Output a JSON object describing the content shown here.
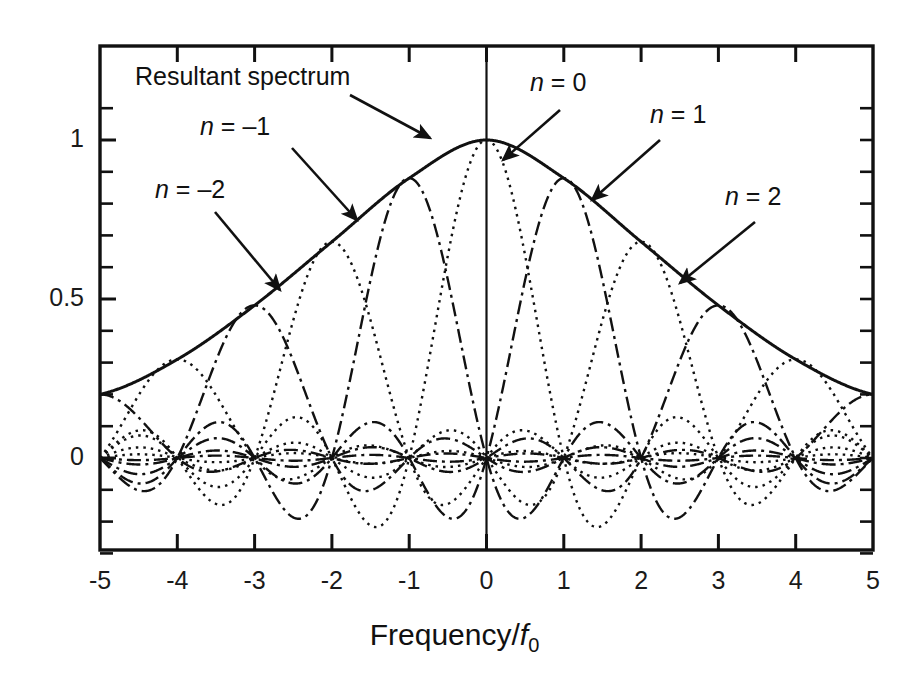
{
  "chart_data": {
    "type": "line",
    "title": "",
    "xlabel": "Frequency/f0",
    "xlabel_parts": {
      "prefix": "Frequency/",
      "italic": "f",
      "sub": "0"
    },
    "ylabel": "",
    "xlim": [
      -5,
      5
    ],
    "ylim": [
      -0.32,
      1.12
    ],
    "grid": false,
    "legend_position": "annotations-with-arrows",
    "x_ticks": [
      -5,
      -4,
      -3,
      -2,
      -1,
      0,
      1,
      2,
      3,
      4,
      5
    ],
    "x_tick_labels": [
      "-5",
      "-4",
      "-3",
      "-2",
      "-1",
      "0",
      "1",
      "2",
      "3",
      "4",
      "5"
    ],
    "y_ticks": [
      0,
      0.5,
      1
    ],
    "y_tick_labels": [
      "0",
      "0.5",
      "1"
    ],
    "y_minor_ticks": [
      -0.3,
      -0.2,
      -0.1,
      0.1,
      0.2,
      0.3,
      0.4,
      0.6,
      0.7,
      0.8,
      0.9,
      1.1
    ],
    "series": [
      {
        "name": "Resultant spectrum",
        "style": "solid",
        "description": "Envelope of all sinc lobe peaks, Gaussian-like, peak 1.0 at x=0, about 0.2 at x=-5 and x=5",
        "key_points": [
          {
            "x": -5,
            "y": 0.2
          },
          {
            "x": -4,
            "y": 0.31
          },
          {
            "x": -3,
            "y": 0.48
          },
          {
            "x": -2,
            "y": 0.68
          },
          {
            "x": -1,
            "y": 0.88
          },
          {
            "x": 0,
            "y": 1.0
          },
          {
            "x": 1,
            "y": 0.88
          },
          {
            "x": 2,
            "y": 0.68
          },
          {
            "x": 3,
            "y": 0.48
          },
          {
            "x": 4,
            "y": 0.31
          },
          {
            "x": 5,
            "y": 0.2
          }
        ]
      },
      {
        "name": "n = -2",
        "style": "dotted",
        "center": -2,
        "amplitude": 0.68,
        "description": "sinc lobe centered at x=-2"
      },
      {
        "name": "n = -1",
        "style": "dashdot",
        "center": -1,
        "amplitude": 0.88,
        "description": "sinc lobe centered at x=-1"
      },
      {
        "name": "n = 0",
        "style": "dotted",
        "center": 0,
        "amplitude": 1.0,
        "description": "sinc lobe centered at x=0"
      },
      {
        "name": "n = 1",
        "style": "dashdot",
        "center": 1,
        "amplitude": 0.88,
        "description": "sinc lobe centered at x=1"
      },
      {
        "name": "n = 2",
        "style": "dotted",
        "center": 2,
        "amplitude": 0.68,
        "description": "sinc lobe centered at x=2"
      },
      {
        "name": "n = -5",
        "style": "dashdot",
        "center": -5,
        "amplitude": 0.2,
        "description": "sinc lobe centered at x=-5"
      },
      {
        "name": "n = -4",
        "style": "dotted",
        "center": -4,
        "amplitude": 0.31,
        "description": "sinc lobe centered at x=-4"
      },
      {
        "name": "n = -3",
        "style": "dashdot",
        "center": -3,
        "amplitude": 0.48,
        "description": "sinc lobe centered at x=-3"
      },
      {
        "name": "n = 3",
        "style": "dashdot",
        "center": 3,
        "amplitude": 0.48,
        "description": "sinc lobe centered at x=3"
      },
      {
        "name": "n = 4",
        "style": "dotted",
        "center": 4,
        "amplitude": 0.31,
        "description": "sinc lobe centered at x=4"
      },
      {
        "name": "n = 5",
        "style": "dashdot",
        "center": 5,
        "amplitude": 0.2,
        "description": "sinc lobe centered at x=5"
      }
    ],
    "annotations": [
      {
        "text": "Resultant spectrum",
        "label_x": 135,
        "label_y": 62,
        "arrow_from_x": 350,
        "arrow_from_y": 95,
        "arrow_to_x": 430,
        "arrow_to_y": 138
      },
      {
        "text": "n = -1",
        "label_x": 200,
        "label_y": 112,
        "arrow_from_x": 292,
        "arrow_from_y": 148,
        "arrow_to_x": 357,
        "arrow_to_y": 220
      },
      {
        "text": "n = -2",
        "label_x": 155,
        "label_y": 175,
        "arrow_from_x": 215,
        "arrow_from_y": 212,
        "arrow_to_x": 280,
        "arrow_to_y": 290
      },
      {
        "text": "n = 0",
        "label_x": 530,
        "label_y": 68,
        "arrow_from_x": 560,
        "arrow_from_y": 110,
        "arrow_to_x": 503,
        "arrow_to_y": 160
      },
      {
        "text": "n = 1",
        "label_x": 650,
        "label_y": 100,
        "arrow_from_x": 660,
        "arrow_from_y": 140,
        "arrow_to_x": 592,
        "arrow_to_y": 200
      },
      {
        "text": "n = 2",
        "label_x": 725,
        "label_y": 182,
        "arrow_from_x": 755,
        "arrow_from_y": 222,
        "arrow_to_x": 680,
        "arrow_to_y": 283
      }
    ],
    "axis_colors": {
      "frame": "#111111",
      "curve": "#111111",
      "text": "#1a1a1a"
    }
  },
  "layout": {
    "plot_left_px": 100,
    "plot_right_px": 873,
    "plot_top_px": 46,
    "plot_bottom_px": 550,
    "y_zero_px": 458,
    "y_one_px": 140
  }
}
